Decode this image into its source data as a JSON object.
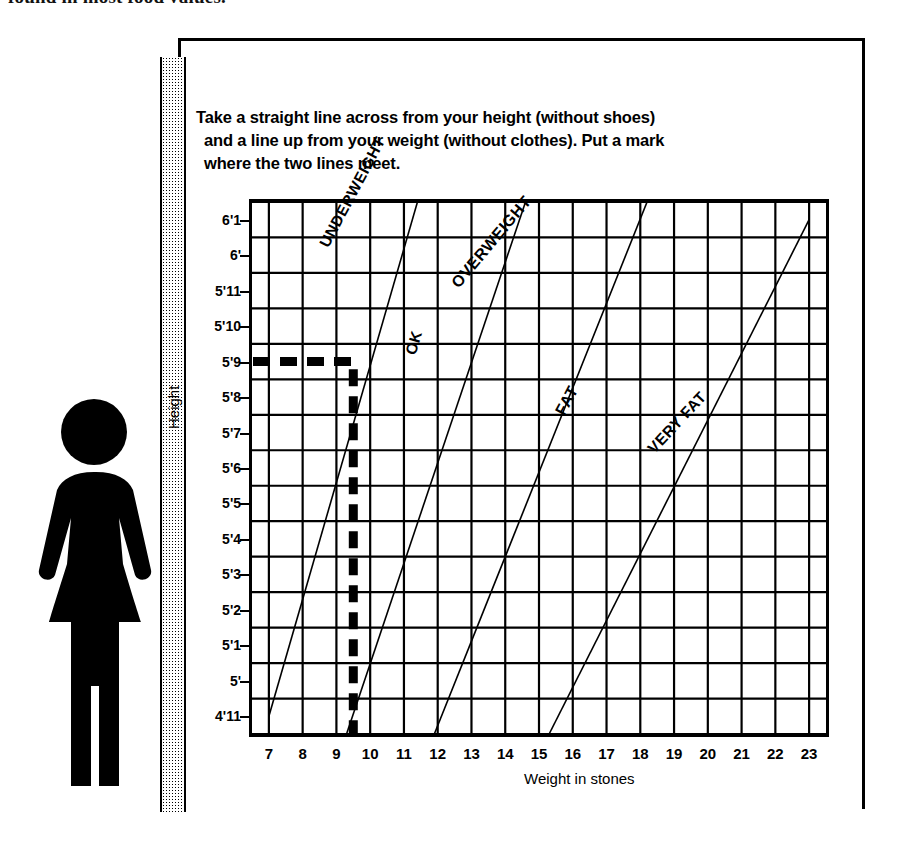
{
  "page": {
    "clipped_heading": "found in most food values.",
    "instructions": [
      "Take a straight line across from your height (without shoes)",
      "and a line up from your weight (without clothes). Put a mark",
      "where the two lines meet."
    ]
  },
  "chart_data": {
    "type": "line",
    "xlabel": "Weight in stones",
    "ylabel": "Height",
    "xlim": [
      6.5,
      23.5
    ],
    "ylim": [
      "4'10",
      "6'1.5"
    ],
    "grid": true,
    "legend_position": "inline-diagonal-labels",
    "x_ticks": [
      "7",
      "8",
      "9",
      "10",
      "11",
      "12",
      "13",
      "14",
      "15",
      "16",
      "17",
      "18",
      "19",
      "20",
      "21",
      "22",
      "23"
    ],
    "y_ticks": [
      "6'1",
      "6'",
      "5'11",
      "5'10",
      "5'9",
      "5'8",
      "5'7",
      "5'6",
      "5'5",
      "5'4",
      "5'3",
      "5'2",
      "5'1",
      "5'",
      "4'11"
    ],
    "bands": [
      {
        "name": "UNDERWEIGHT",
        "rotation": -62
      },
      {
        "name": "OK",
        "rotation": -74
      },
      {
        "name": "OVERWEIGHT",
        "rotation": -50
      },
      {
        "name": "FAT",
        "rotation": -62
      },
      {
        "name": "VERY FAT",
        "rotation": -47
      }
    ],
    "series": [
      {
        "name": "underweight-ok boundary",
        "x": [
          7.0,
          11.4
        ],
        "y_labels": [
          "4'11",
          "6'1.5"
        ]
      },
      {
        "name": "ok-overweight boundary",
        "x": [
          9.3,
          14.6
        ],
        "y_labels": [
          "4'10.5",
          "6'1.5"
        ]
      },
      {
        "name": "overweight-fat boundary",
        "x": [
          11.9,
          18.2
        ],
        "y_labels": [
          "4'10.5",
          "6'1.5"
        ]
      },
      {
        "name": "fat-veryfat boundary",
        "x": [
          15.3,
          23.0
        ],
        "y_labels": [
          "4'10.5",
          "6'1"
        ]
      }
    ],
    "example_marker": {
      "height": "5'9",
      "weight_stones": 9.5,
      "style": "bold dashed",
      "description": "Bold dashed horizontal line at 5'9 meeting bold dashed vertical line at about 9.5 stones"
    }
  },
  "figure": {
    "alt": "Silhouette of a woman standing against the wall"
  }
}
